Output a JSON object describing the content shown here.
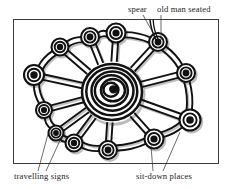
{
  "figure": {
    "background_color": "#ffffff",
    "ink_color": "#111111",
    "frame_color": "#3b3b3b",
    "frame": {
      "x": 13,
      "y": 19,
      "width": 205,
      "height": 144
    }
  },
  "labels": {
    "spear": "spear",
    "old_man_seated": "old man seated",
    "travelling_signs": "travelling signs",
    "sit_down_places": "sit-down places"
  },
  "label_positions": {
    "spear": {
      "x": 128,
      "y": 12
    },
    "old_man_seated": {
      "x": 157,
      "y": 12
    },
    "travelling_signs": {
      "x": 14,
      "y": 179
    },
    "sit_down_places": {
      "x": 136,
      "y": 179
    }
  },
  "leader_lines": [
    {
      "name": "spear-leader",
      "x1": 143,
      "y1": 15,
      "x2": 156,
      "y2": 38
    },
    {
      "name": "old-man-seated-leader",
      "x1": 161,
      "y1": 15,
      "x2": 161,
      "y2": 40
    },
    {
      "name": "travelling-signs-leader-a",
      "x1": 38,
      "y1": 171,
      "x2": 48,
      "y2": 134
    },
    {
      "name": "travelling-signs-leader-b",
      "x1": 46,
      "y1": 171,
      "x2": 62,
      "y2": 136
    },
    {
      "name": "sit-down-places-leader-a",
      "x1": 153,
      "y1": 171,
      "x2": 151,
      "y2": 146
    },
    {
      "name": "sit-down-places-leader-b",
      "x1": 163,
      "y1": 171,
      "x2": 180,
      "y2": 132
    }
  ],
  "spear_line": {
    "x1": 156,
    "y1": 40,
    "x2": 150,
    "y2": 20
  },
  "central_spiral": {
    "name": "central-ceremonial-ground",
    "center": {
      "x": 112,
      "y": 92
    },
    "ring_radii": [
      30,
      25.5,
      21,
      16.5,
      12,
      7.5,
      3.5
    ],
    "ring_count": 7
  },
  "outer_circles": [
    {
      "name": "node-1",
      "cx": 116,
      "cy": 33,
      "r_outer": 9.5,
      "r_mid": 6.0,
      "r_inner": 2.8,
      "angle_deg": 265
    },
    {
      "name": "node-2",
      "cx": 158,
      "cy": 42,
      "r_outer": 9.0,
      "r_mid": 5.6,
      "r_inner": 2.6,
      "angle_deg": 305
    },
    {
      "name": "node-3",
      "cx": 186,
      "cy": 73,
      "r_outer": 9.0,
      "r_mid": 5.6,
      "r_inner": 2.6,
      "angle_deg": 340
    },
    {
      "name": "node-4",
      "cx": 190,
      "cy": 120,
      "r_outer": 10.5,
      "r_mid": 6.6,
      "r_inner": 3.0,
      "angle_deg": 30
    },
    {
      "name": "node-5",
      "cx": 154,
      "cy": 139,
      "r_outer": 9.5,
      "r_mid": 6.0,
      "r_inner": 2.8,
      "angle_deg": 62
    },
    {
      "name": "node-6",
      "cx": 108,
      "cy": 150,
      "r_outer": 9.0,
      "r_mid": 5.6,
      "r_inner": 2.6,
      "angle_deg": 90
    },
    {
      "name": "node-7",
      "cx": 74,
      "cy": 143,
      "r_outer": 8.5,
      "r_mid": 5.3,
      "r_inner": 2.4,
      "angle_deg": 115
    },
    {
      "name": "node-8",
      "cx": 56,
      "cy": 133,
      "r_outer": 7.5,
      "r_mid": 4.6,
      "r_inner": 2.1,
      "angle_deg": 130
    },
    {
      "name": "node-9",
      "cx": 44,
      "cy": 110,
      "r_outer": 8.0,
      "r_mid": 5.0,
      "r_inner": 2.3,
      "angle_deg": 155
    },
    {
      "name": "node-10",
      "cx": 34,
      "cy": 75,
      "r_outer": 10.0,
      "r_mid": 6.3,
      "r_inner": 2.9,
      "angle_deg": 190
    },
    {
      "name": "node-11",
      "cx": 60,
      "cy": 47,
      "r_outer": 8.5,
      "r_mid": 5.3,
      "r_inner": 2.4,
      "angle_deg": 222
    },
    {
      "name": "node-12",
      "cx": 90,
      "cy": 37,
      "r_outer": 9.0,
      "r_mid": 5.6,
      "r_inner": 2.6,
      "angle_deg": 245
    }
  ],
  "description": {
    "type": "line-art diagram",
    "motif": "concentric spiral with radiating double-line spokes to twelve ringed nodes joined by an outer perimeter band"
  }
}
